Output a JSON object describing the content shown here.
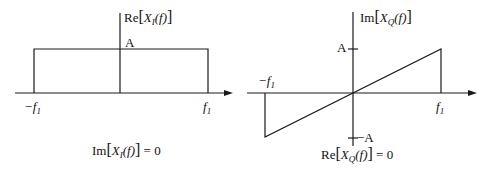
{
  "figure": {
    "left_panel": {
      "title": "In-phase component spectrum",
      "y_axis_label": {
        "prefix": "Re",
        "var": "X",
        "sub": "I",
        "arg": "(f)"
      },
      "level_label": "A",
      "x_ticks": [
        {
          "text": "−f",
          "sub": "1"
        },
        {
          "text": "f",
          "sub": "1"
        }
      ],
      "caption": {
        "prefix": "Im",
        "var": "X",
        "sub": "I",
        "arg": "(f)",
        "eq": " = 0"
      },
      "shape": "rectangle",
      "points": [
        [
          -1,
          0
        ],
        [
          -1,
          1
        ],
        [
          1,
          1
        ],
        [
          1,
          0
        ]
      ]
    },
    "right_panel": {
      "title": "Quadrature component spectrum",
      "y_axis_label": {
        "prefix": "Im",
        "var": "X",
        "sub": "Q",
        "arg": "(f)"
      },
      "pos_level_label": "A",
      "neg_level_label": "−A",
      "x_ticks": [
        {
          "text": "−f",
          "sub": "1"
        },
        {
          "text": "f",
          "sub": "1"
        }
      ],
      "caption": {
        "prefix": "Re",
        "var": "X",
        "sub": "Q",
        "arg": "(f)",
        "eq": " = 0"
      },
      "shape": "linear ramp",
      "points": [
        [
          -1,
          0
        ],
        [
          -1,
          -1
        ],
        [
          1,
          1
        ],
        [
          1,
          0
        ]
      ]
    },
    "colors": {
      "line": "#1a1a1a",
      "background": "#ffffff"
    }
  }
}
